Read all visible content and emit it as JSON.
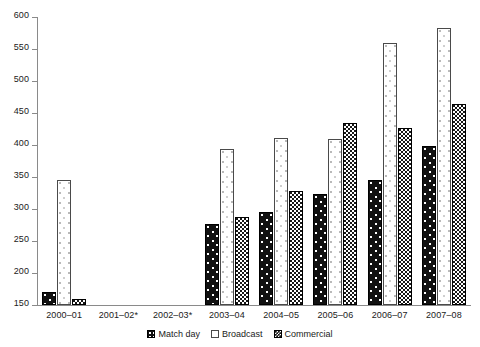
{
  "chart_data": {
    "type": "bar",
    "title": "",
    "xlabel": "",
    "ylabel": "",
    "ylim": [
      150,
      600
    ],
    "yticks": [
      150,
      200,
      250,
      300,
      350,
      400,
      450,
      500,
      550,
      600
    ],
    "grid": false,
    "legend_position": "bottom-center",
    "categories": [
      "2000–01",
      "2001–02*",
      "2002–03*",
      "2003–04",
      "2004–05",
      "2005–06",
      "2006–07",
      "2007–08"
    ],
    "series": [
      {
        "name": "Match day",
        "values": [
          170,
          null,
          null,
          277,
          296,
          323,
          346,
          398
        ]
      },
      {
        "name": "Broadcast",
        "values": [
          345,
          null,
          null,
          393,
          411,
          409,
          560,
          583
        ]
      },
      {
        "name": "Commercial",
        "values": [
          160,
          null,
          null,
          288,
          328,
          434,
          427,
          464
        ]
      }
    ]
  },
  "legend": {
    "items": [
      {
        "label": "Match day",
        "swatch": "matchday-swatch"
      },
      {
        "label": "Broadcast",
        "swatch": "broadcast-swatch"
      },
      {
        "label": "Commercial",
        "swatch": "commercial-swatch"
      }
    ]
  },
  "axis": {
    "y_tick_labels": [
      "600",
      "550",
      "500",
      "450",
      "400",
      "350",
      "300",
      "250",
      "200",
      "150"
    ]
  }
}
